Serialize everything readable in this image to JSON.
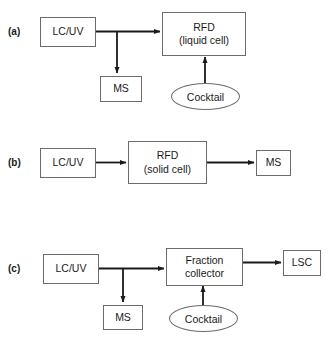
{
  "figure": {
    "panels": [
      {
        "id": "a",
        "label": "(a)",
        "nodes": {
          "source": {
            "name": "lc-uv",
            "line1": "LC/UV",
            "line2": ""
          },
          "detector": {
            "name": "rfd-liquid-cell",
            "line1": "RFD",
            "line2": "(liquid cell)"
          },
          "ms": {
            "name": "ms",
            "line1": "MS",
            "line2": ""
          },
          "cocktail": {
            "name": "cocktail",
            "line1": "Cocktail",
            "line2": ""
          }
        }
      },
      {
        "id": "b",
        "label": "(b)",
        "nodes": {
          "source": {
            "name": "lc-uv",
            "line1": "LC/UV",
            "line2": ""
          },
          "detector": {
            "name": "rfd-solid-cell",
            "line1": "RFD",
            "line2": "(solid cell)"
          },
          "ms": {
            "name": "ms",
            "line1": "MS",
            "line2": ""
          }
        }
      },
      {
        "id": "c",
        "label": "(c)",
        "nodes": {
          "source": {
            "name": "lc-uv",
            "line1": "LC/UV",
            "line2": ""
          },
          "collector": {
            "name": "fraction-collector",
            "line1": "Fraction",
            "line2": "collector"
          },
          "ms": {
            "name": "ms",
            "line1": "MS",
            "line2": ""
          },
          "cocktail": {
            "name": "cocktail",
            "line1": "Cocktail",
            "line2": ""
          },
          "lsc": {
            "name": "lsc",
            "line1": "LSC",
            "line2": ""
          }
        }
      }
    ]
  },
  "colors": {
    "stroke": "#6b6b6b",
    "arrow": "#1a1a1a",
    "text": "#1a1a1a",
    "background": "#ffffff"
  }
}
